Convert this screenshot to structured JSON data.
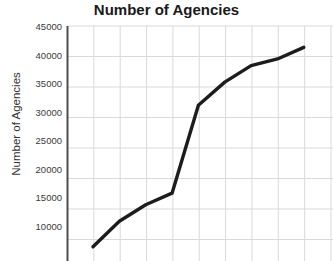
{
  "chart_data": {
    "type": "line",
    "title": "Number of Agencies",
    "xlabel": "",
    "ylabel": "Number of Agencies",
    "ylim": [
      5000,
      45000
    ],
    "yticks": [
      10000,
      15000,
      20000,
      25000,
      30000,
      35000,
      40000,
      45000
    ],
    "ytick_labels": [
      "10000",
      "15000",
      "20000",
      "25000",
      "30000",
      "35000",
      "40000",
      "45000"
    ],
    "grid": true,
    "legend": false,
    "line_color": "#1c1c1c",
    "grid_color": "#d9d9d9",
    "axis_color": "#4d4d4d",
    "x": [
      1,
      2,
      3,
      4,
      5,
      6,
      7,
      8,
      9
    ],
    "values": [
      8800,
      13000,
      15700,
      17600,
      32000,
      35800,
      38500,
      39600,
      41500
    ],
    "series": [
      {
        "name": "Number of Agencies",
        "values": [
          8800,
          13000,
          15700,
          17600,
          32000,
          35800,
          38500,
          39600,
          41500
        ]
      }
    ]
  },
  "axis": {
    "y_title": "Number of Agencies",
    "tick_0": "10000",
    "tick_1": "15000",
    "tick_2": "20000",
    "tick_3": "25000",
    "tick_4": "30000",
    "tick_5": "35000",
    "tick_6": "40000",
    "tick_7": "45000"
  },
  "header": {
    "title": "Number of Agencies"
  }
}
